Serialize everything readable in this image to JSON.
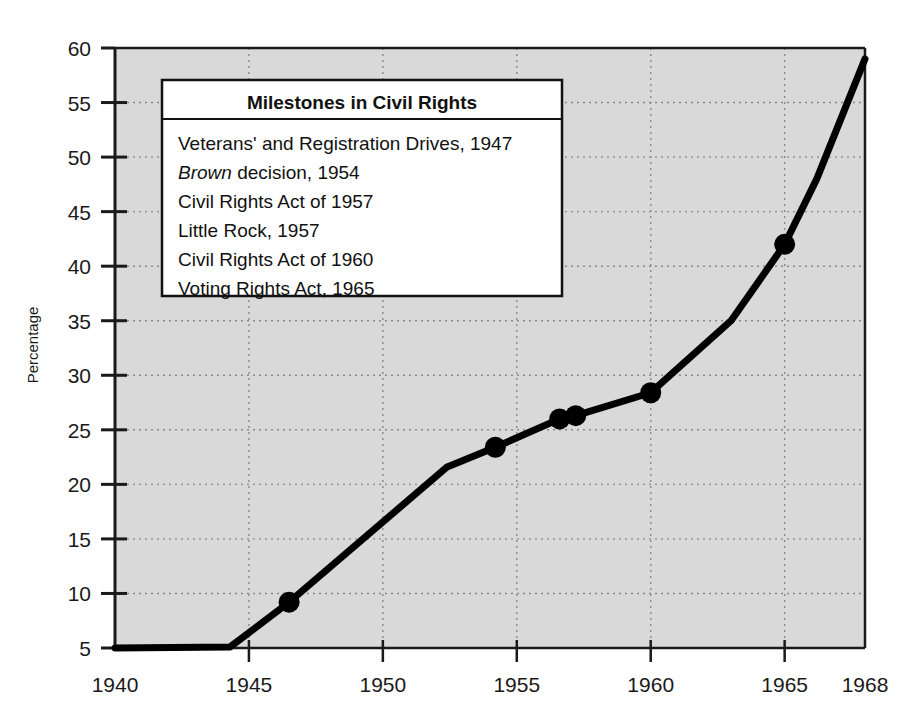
{
  "chart_data": {
    "type": "line",
    "title": "",
    "xlabel": "",
    "ylabel": "Percentage",
    "xlim": [
      1940,
      1968
    ],
    "ylim": [
      5,
      60
    ],
    "grid": true,
    "xticks": [
      1940,
      1945,
      1950,
      1955,
      1960,
      1965,
      1968
    ],
    "yticks": [
      5,
      10,
      15,
      20,
      25,
      30,
      35,
      40,
      45,
      50,
      55,
      60
    ],
    "xtick_labels": [
      "1940",
      "1945",
      "1950",
      "1955",
      "1960",
      "1965",
      "1968"
    ],
    "ytick_labels": [
      "5",
      "10",
      "15",
      "20",
      "25",
      "30",
      "35",
      "40",
      "45",
      "50",
      "55",
      "60"
    ],
    "series": [
      {
        "name": "Percentage",
        "color": "#000000",
        "x": [
          1940.0,
          1944.3,
          1946.5,
          1952.4,
          1954.2,
          1956.6,
          1957.2,
          1960.0,
          1963.0,
          1965.0,
          1966.2,
          1968.0
        ],
        "y": [
          5.0,
          5.1,
          9.2,
          21.6,
          23.4,
          26.0,
          26.3,
          28.4,
          35.0,
          42.0,
          48.0,
          59.0
        ]
      }
    ],
    "markers": [
      {
        "x": 1946.5,
        "y": 9.2
      },
      {
        "x": 1954.2,
        "y": 23.4
      },
      {
        "x": 1956.6,
        "y": 26.0
      },
      {
        "x": 1957.2,
        "y": 26.3
      },
      {
        "x": 1960.0,
        "y": 28.4
      },
      {
        "x": 1965.0,
        "y": 42.0
      }
    ],
    "plot_bg_color": "#d9d9d9",
    "grid_color": "#8a8a8a",
    "line_color": "#000000"
  },
  "legend": {
    "title": "Milestones in Civil Rights",
    "items": [
      {
        "text": "Veterans' and Registration Drives, 1947",
        "italic_prefix": ""
      },
      {
        "text": "decision, 1954",
        "italic_prefix": "Brown"
      },
      {
        "text": "Civil Rights Act of 1957",
        "italic_prefix": ""
      },
      {
        "text": "Little Rock, 1957",
        "italic_prefix": ""
      },
      {
        "text": "Civil Rights Act of 1960",
        "italic_prefix": ""
      },
      {
        "text": "Voting Rights Act, 1965",
        "italic_prefix": ""
      }
    ]
  }
}
